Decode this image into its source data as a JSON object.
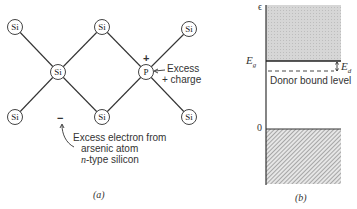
{
  "panel_a": {
    "caption": "(a)",
    "atoms": [
      {
        "id": "si-top-left",
        "label": "Si",
        "x": 15,
        "y": 27
      },
      {
        "id": "si-top-mid",
        "label": "Si",
        "x": 102,
        "y": 27
      },
      {
        "id": "si-top-right",
        "label": "Si",
        "x": 189,
        "y": 29
      },
      {
        "id": "si-center",
        "label": "Si",
        "x": 58,
        "y": 72
      },
      {
        "id": "p-donor",
        "label": "P",
        "x": 146,
        "y": 72
      },
      {
        "id": "si-bottom-left",
        "label": "Si",
        "x": 15,
        "y": 117
      },
      {
        "id": "si-bottom-mid",
        "label": "Si",
        "x": 102,
        "y": 117
      },
      {
        "id": "si-bottom-right",
        "label": "Si",
        "x": 189,
        "y": 117
      }
    ],
    "plus_sign": "+",
    "excess_charge_label_line1": "Excess",
    "excess_charge_label_line2": "+ charge",
    "electron_mark": "−",
    "electron_note_line1": "Excess electron from",
    "electron_note_line2": "arsenic atom",
    "electron_note_line3_italic": "n",
    "electron_note_line3_rest": "-type silicon"
  },
  "panel_b": {
    "caption": "(b)",
    "axis_label_top": "ϵ",
    "eg_label_main": "E",
    "eg_label_sub": "g",
    "ed_label_main": "E",
    "ed_label_sub": "d",
    "donor_level_label": "Donor bound level",
    "zero_label": "0",
    "colors": {
      "conduction_band": "#d4d4d4",
      "valence_band_hatch": "#9a9a9a",
      "line": "#333333"
    }
  }
}
